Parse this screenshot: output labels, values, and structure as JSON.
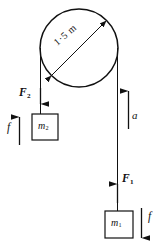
{
  "figure": {
    "name": "pulley-two-mass-free-body-diagram",
    "background_color": "#ffffff",
    "stroke_color": "#111111"
  },
  "pulley": {
    "label_diameter": "1·5 m",
    "center_x": 79,
    "center_y": 48,
    "radius": 39
  },
  "left_side": {
    "tension_label": "F",
    "tension_subscript": "2",
    "tension_direction": "down",
    "mass_label": "m",
    "mass_subscript": "2",
    "friction_label": "f",
    "friction_direction": "up"
  },
  "right_side": {
    "acceleration_label": "a",
    "acceleration_direction": "up",
    "tension_label": "F",
    "tension_subscript": "1",
    "tension_direction": "up",
    "mass_label": "m",
    "mass_subscript": "1",
    "friction_label": "f",
    "friction_direction": "down"
  }
}
